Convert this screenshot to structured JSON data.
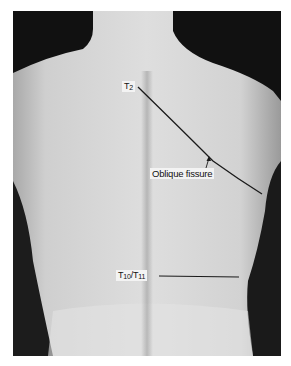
{
  "figure": {
    "colors": {
      "background": "#111111",
      "skin_light": "#d9d9d9",
      "skin_mid": "#bdbdbd",
      "line": "#1a1a1a"
    },
    "labels": {
      "t2": {
        "main": "T",
        "sub": "2"
      },
      "oblique_fissure": "Oblique fissure",
      "t10_t11": {
        "main1": "T",
        "sub1": "10",
        "sep": "/T",
        "sub2": "11"
      }
    }
  }
}
